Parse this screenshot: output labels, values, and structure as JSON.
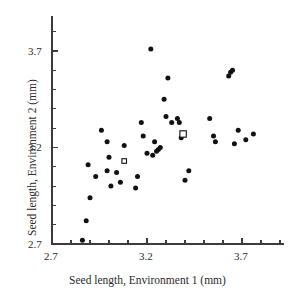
{
  "chart_data": {
    "type": "scatter",
    "title": "",
    "xlabel": "Seed length, Environment 1 (mm)",
    "ylabel": "Seed length, Environment 2 (mm)",
    "xlim": [
      2.7,
      3.92
    ],
    "ylim": [
      2.7,
      3.88
    ],
    "xticks": [
      2.7,
      3.2,
      3.7
    ],
    "xtick_labels": [
      "2.7",
      "3.2",
      "3.7"
    ],
    "yticks": [
      2.7,
      3.2,
      3.7
    ],
    "ytick_labels": [
      "2.7",
      "3.2",
      "3.7"
    ],
    "minor_tick_step": 0.1,
    "grid": false,
    "legend": null,
    "series": [
      {
        "name": "family means",
        "marker": "filled-circle",
        "color": "#111111",
        "points": [
          [
            2.86,
            2.72
          ],
          [
            2.88,
            2.82
          ],
          [
            2.89,
            3.11
          ],
          [
            2.9,
            2.94
          ],
          [
            2.93,
            3.05
          ],
          [
            2.96,
            3.29
          ],
          [
            2.99,
            3.23
          ],
          [
            2.99,
            3.08
          ],
          [
            3.0,
            3.15
          ],
          [
            3.01,
            3.0
          ],
          [
            3.04,
            3.07
          ],
          [
            3.06,
            3.02
          ],
          [
            3.08,
            3.21
          ],
          [
            3.14,
            2.99
          ],
          [
            3.15,
            3.05
          ],
          [
            3.17,
            3.33
          ],
          [
            3.18,
            3.26
          ],
          [
            3.2,
            3.17
          ],
          [
            3.22,
            3.71
          ],
          [
            3.23,
            3.16
          ],
          [
            3.24,
            3.23
          ],
          [
            3.25,
            3.18
          ],
          [
            3.26,
            3.19
          ],
          [
            3.27,
            3.2
          ],
          [
            3.29,
            3.45
          ],
          [
            3.3,
            3.36
          ],
          [
            3.31,
            3.56
          ],
          [
            3.33,
            3.33
          ],
          [
            3.36,
            3.35
          ],
          [
            3.37,
            3.33
          ],
          [
            3.38,
            3.25
          ],
          [
            3.4,
            3.03
          ],
          [
            3.42,
            3.08
          ],
          [
            3.53,
            3.35
          ],
          [
            3.55,
            3.26
          ],
          [
            3.56,
            3.23
          ],
          [
            3.63,
            3.57
          ],
          [
            3.64,
            3.59
          ],
          [
            3.65,
            3.6
          ],
          [
            3.66,
            3.22
          ],
          [
            3.68,
            3.29
          ],
          [
            3.72,
            3.24
          ],
          [
            3.76,
            3.27
          ]
        ]
      },
      {
        "name": "overall mean",
        "marker": "open-square",
        "color": "#111111",
        "points": [
          [
            3.39,
            3.27
          ]
        ]
      },
      {
        "name": "secondary open-square marker",
        "marker": "open-square-small",
        "color": "#111111",
        "points": [
          [
            3.08,
            3.13
          ]
        ]
      }
    ]
  }
}
